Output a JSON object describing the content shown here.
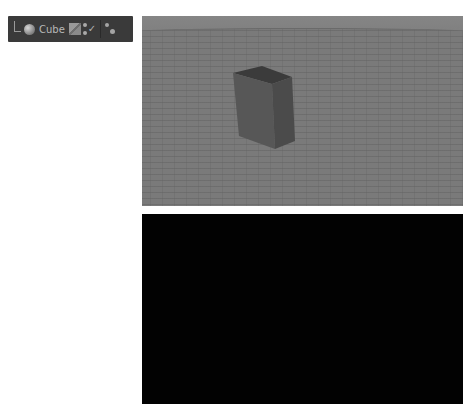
{
  "top_text": "",
  "toolbar": {
    "object_label": "Cube",
    "icons": [
      "tree-connector",
      "object-sphere-icon",
      "material-swatch-icon",
      "visibility-dots-check-icon",
      "tag-icon"
    ]
  },
  "viewport": {
    "background": "#7b7b7b",
    "object": "Cube",
    "cube_colors": {
      "top": "#3c3c3c",
      "left": "#555555",
      "right": "#4a4a4a"
    }
  },
  "render_panel": {
    "background": "#020202"
  }
}
